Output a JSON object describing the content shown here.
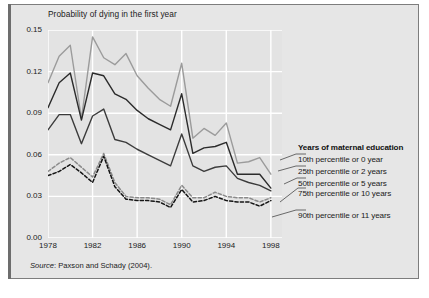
{
  "chart_data": {
    "type": "line",
    "title": "Probability of dying in the first year",
    "xlabel": "",
    "ylabel": "",
    "xlim": [
      1978,
      1999
    ],
    "ylim": [
      0.0,
      0.15
    ],
    "grid": true,
    "legend_position": "right-outside",
    "legend_title": "Years of maternal education",
    "yticks": [
      "0.00",
      "0.03",
      "0.06",
      "0.09",
      "0.12",
      "0.15"
    ],
    "ytick_values": [
      0.0,
      0.03,
      0.06,
      0.09,
      0.12,
      0.15
    ],
    "xticks": [
      "1978",
      "1982",
      "1986",
      "1990",
      "1994",
      "1998"
    ],
    "xtick_values": [
      1978,
      1982,
      1986,
      1990,
      1994,
      1998
    ],
    "x": [
      1978,
      1979,
      1980,
      1981,
      1982,
      1983,
      1984,
      1985,
      1986,
      1987,
      1988,
      1989,
      1990,
      1991,
      1992,
      1993,
      1994,
      1995,
      1996,
      1997,
      1998
    ],
    "series": [
      {
        "name": "10th percentile or 0 year",
        "color": "#9b9b9b",
        "style": "solid",
        "values": [
          0.112,
          0.131,
          0.139,
          0.086,
          0.145,
          0.13,
          0.125,
          0.133,
          0.117,
          0.108,
          0.1,
          0.095,
          0.126,
          0.072,
          0.079,
          0.074,
          0.083,
          0.054,
          0.055,
          0.058,
          0.046
        ]
      },
      {
        "name": "25th percentile or 2 years",
        "color": "#2b2b2b",
        "style": "solid",
        "values": [
          0.094,
          0.112,
          0.119,
          0.085,
          0.119,
          0.117,
          0.104,
          0.1,
          0.092,
          0.086,
          0.082,
          0.078,
          0.104,
          0.061,
          0.065,
          0.066,
          0.069,
          0.046,
          0.046,
          0.046,
          0.036
        ]
      },
      {
        "name": "50th percentile or 5 years",
        "color": "#3b3b3b",
        "style": "solid",
        "values": [
          0.078,
          0.089,
          0.089,
          0.068,
          0.088,
          0.093,
          0.071,
          0.069,
          0.064,
          0.06,
          0.056,
          0.052,
          0.075,
          0.052,
          0.048,
          0.051,
          0.052,
          0.043,
          0.04,
          0.038,
          0.034
        ]
      },
      {
        "name": "75th percentile or 10 years",
        "color": "#8a8a8a",
        "style": "dashed",
        "values": [
          0.048,
          0.054,
          0.058,
          0.051,
          0.044,
          0.061,
          0.04,
          0.03,
          0.029,
          0.029,
          0.028,
          0.024,
          0.038,
          0.029,
          0.029,
          0.033,
          0.03,
          0.029,
          0.029,
          0.026,
          0.029
        ]
      },
      {
        "name": "90th percentile or 11 years",
        "color": "#141414",
        "style": "dashed",
        "values": [
          0.045,
          0.048,
          0.053,
          0.047,
          0.04,
          0.059,
          0.037,
          0.028,
          0.027,
          0.027,
          0.026,
          0.022,
          0.035,
          0.026,
          0.027,
          0.03,
          0.027,
          0.026,
          0.026,
          0.023,
          0.027
        ]
      }
    ]
  },
  "legend": {
    "title": "Years of maternal education",
    "items": [
      "10th percentile or 0 year",
      "25th percentile or 2 years",
      "50th percentile or 5 years",
      "75th percentile or 10 years",
      "90th percentile or 11 years"
    ]
  },
  "source": {
    "label": "Source",
    "text": ": Paxson and Schady (2004)."
  }
}
